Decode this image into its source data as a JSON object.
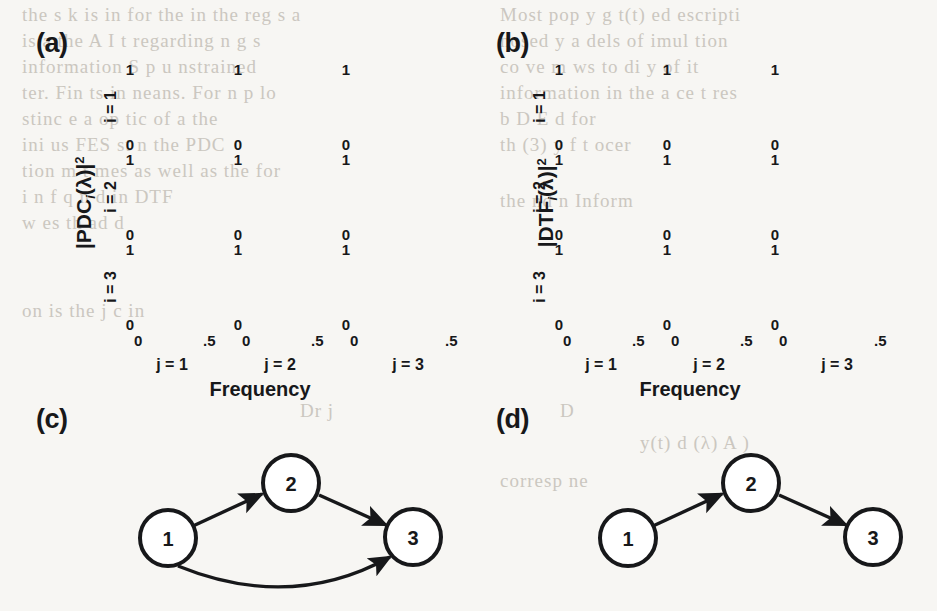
{
  "figure": {
    "background_color": "#f7f6f3",
    "ink_color": "#17181a",
    "shade_color": "#bdbdbd",
    "band_color": "#9a9a9a"
  },
  "panels": [
    {
      "id": "a",
      "label": "(a)"
    },
    {
      "id": "b",
      "label": "(b)"
    },
    {
      "id": "c",
      "label": "(c)"
    },
    {
      "id": "d",
      "label": "(d)"
    }
  ],
  "panel_a": {
    "letter": "(a)",
    "y_title_prefix": "|",
    "y_title_name": "PDC",
    "y_title_sub": "i",
    "y_title_mid": "(λ)|",
    "y_title_sup": "2",
    "x_title": "Frequency",
    "row_labels": [
      "i = 1",
      "i = 2",
      "i = 3"
    ],
    "col_labels": [
      "j = 1",
      "j = 2",
      "j = 3"
    ],
    "y_ticks": [
      "1",
      "0"
    ],
    "x_ticks": [
      "0",
      ".5"
    ]
  },
  "panel_b": {
    "letter": "(b)",
    "y_title_prefix": "|",
    "y_title_name": "DTF",
    "y_title_sub": "i",
    "y_title_mid": "(λ)|",
    "y_title_sup": "2",
    "x_title": "Frequency",
    "row_labels": [
      "i = 1",
      "i = 2",
      "i = 3"
    ],
    "col_labels": [
      "j = 1",
      "j = 2",
      "j = 3"
    ],
    "y_ticks": [
      "1",
      "0"
    ],
    "x_ticks": [
      "0",
      ".5"
    ]
  },
  "panel_c": {
    "letter": "(c)",
    "nodes": [
      {
        "id": "1",
        "label": "1",
        "cx": 50,
        "cy": 98
      },
      {
        "id": "2",
        "label": "2",
        "cx": 173,
        "cy": 43
      },
      {
        "id": "3",
        "label": "3",
        "cx": 295,
        "cy": 97
      }
    ],
    "edges": [
      {
        "from": "1",
        "to": "2",
        "curved": false
      },
      {
        "from": "2",
        "to": "3",
        "curved": false
      },
      {
        "from": "1",
        "to": "3",
        "curved": true
      }
    ]
  },
  "panel_d": {
    "letter": "(d)",
    "nodes": [
      {
        "id": "1",
        "label": "1",
        "cx": 50,
        "cy": 98
      },
      {
        "id": "2",
        "label": "2",
        "cx": 173,
        "cy": 43
      },
      {
        "id": "3",
        "label": "3",
        "cx": 295,
        "cy": 97
      }
    ],
    "edges": [
      {
        "from": "1",
        "to": "2",
        "curved": false
      },
      {
        "from": "2",
        "to": "3",
        "curved": false
      }
    ]
  },
  "background_text": {
    "lines": [
      "the s k is in for the in the  reg  s a",
      "is a the  A    I   t  regarding    n  g s",
      "information  S          p   u           nstrained",
      "ter.  Fin  ts  in    neans.  For  n p    lo",
      "stinc  e  a  op      tic  of  a    the",
      "ini        us       FES   st  n  the  PDC",
      "tion  m  t  mes   as  well  as  the   for",
      "Most  pop     y    g  t(t)   ed  escripti",
      "nosed     y     a    dels of  imul  tion",
      "co     ve  m     ws  to  di    y   of   it",
      "information  in  the  a       ce   t  res",
      "b        D         E   d    for",
      "th        (3)     y   f  t  ocer",
      "i  n    f   q    n      d    in  DTF",
      "w       es   th   ad      d",
      "on  is  the  j    c  in",
      "the  nd  n       Inform",
      "0     Dr              j",
      "y(t)  d  (λ)     A  )",
      "corresp ne"
    ]
  }
}
